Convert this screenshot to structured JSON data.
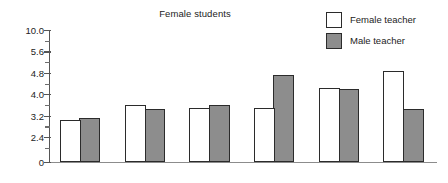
{
  "chart_data": {
    "type": "bar",
    "title": "Female students",
    "xlabel": "",
    "ylabel": "",
    "grid": false,
    "legend_position": "top-right",
    "axis_note": "y-axis tick labels are unevenly valued but evenly spaced (broken scale)",
    "ytick_labels": [
      "10.0",
      "5.6",
      "4.8",
      "4.0",
      "3.2",
      "2.4",
      "0"
    ],
    "ylim": [
      0,
      10.0
    ],
    "categories": [
      "1",
      "2",
      "3",
      "4",
      "5",
      "6"
    ],
    "series": [
      {
        "name": "Female teacher",
        "color": "#ffffff",
        "values": [
          3.05,
          3.6,
          3.5,
          3.5,
          4.25,
          4.85
        ]
      },
      {
        "name": "Male teacher",
        "color": "#8d8d8d",
        "values": [
          3.12,
          3.45,
          3.6,
          4.72,
          4.18,
          3.45
        ]
      }
    ]
  },
  "title": {
    "text": "Female students"
  },
  "legend": {
    "items": [
      {
        "label": "Female teacher",
        "swatch": "white-square-icon",
        "fill": "#ffffff"
      },
      {
        "label": "Male teacher",
        "swatch": "gray-square-icon",
        "fill": "#8d8d8d"
      }
    ]
  },
  "yaxis": {
    "ticks": [
      {
        "label": "10.0",
        "pos": 0
      },
      {
        "label": "5.6",
        "pos": 1
      },
      {
        "label": "4.8",
        "pos": 2
      },
      {
        "label": "4.0",
        "pos": 3
      },
      {
        "label": "3.2",
        "pos": 4
      },
      {
        "label": "2.4",
        "pos": 5
      },
      {
        "label": "0",
        "pos": 6
      }
    ]
  },
  "colors": {
    "female_bar": "#ffffff",
    "male_bar": "#8d8d8d",
    "bar_outline": "#2b2b2b",
    "axis": "#555555",
    "text": "#232323"
  }
}
